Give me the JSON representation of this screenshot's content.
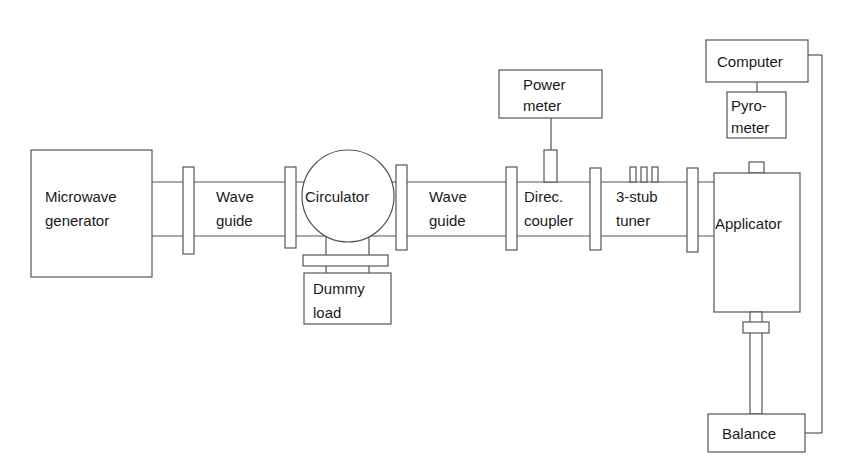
{
  "diagram": {
    "type": "block-diagram",
    "title": "",
    "components": {
      "generator": {
        "line1": "Microwave",
        "line2": "generator"
      },
      "waveguide1": {
        "line1": "Wave",
        "line2": "guide"
      },
      "circulator": {
        "label": "Circulator"
      },
      "dummy_load": {
        "line1": "Dummy",
        "line2": "load"
      },
      "waveguide2": {
        "line1": "Wave",
        "line2": "guide"
      },
      "power_meter": {
        "line1": "Power",
        "line2": "meter"
      },
      "coupler": {
        "line1": "Direc.",
        "line2": "coupler"
      },
      "tuner": {
        "line1": "3-stub",
        "line2": "tuner"
      },
      "applicator": {
        "label": "Applicator"
      },
      "computer": {
        "label": "Computer"
      },
      "pyrometer": {
        "line1": "Pyro-",
        "line2": "meter"
      },
      "balance": {
        "label": "Balance"
      }
    },
    "connections": [
      [
        "Microwave generator",
        "Wave guide"
      ],
      [
        "Wave guide",
        "Circulator"
      ],
      [
        "Circulator",
        "Dummy load"
      ],
      [
        "Circulator",
        "Wave guide"
      ],
      [
        "Wave guide",
        "Direc. coupler"
      ],
      [
        "Direc. coupler",
        "Power meter"
      ],
      [
        "Direc. coupler",
        "3-stub tuner"
      ],
      [
        "3-stub tuner",
        "Applicator"
      ],
      [
        "Applicator",
        "Balance"
      ],
      [
        "Computer",
        "Pyrometer"
      ],
      [
        "Computer",
        "Balance"
      ]
    ],
    "colors": {
      "line": "#555555",
      "text": "#1a1a1a",
      "background": "#ffffff"
    }
  }
}
